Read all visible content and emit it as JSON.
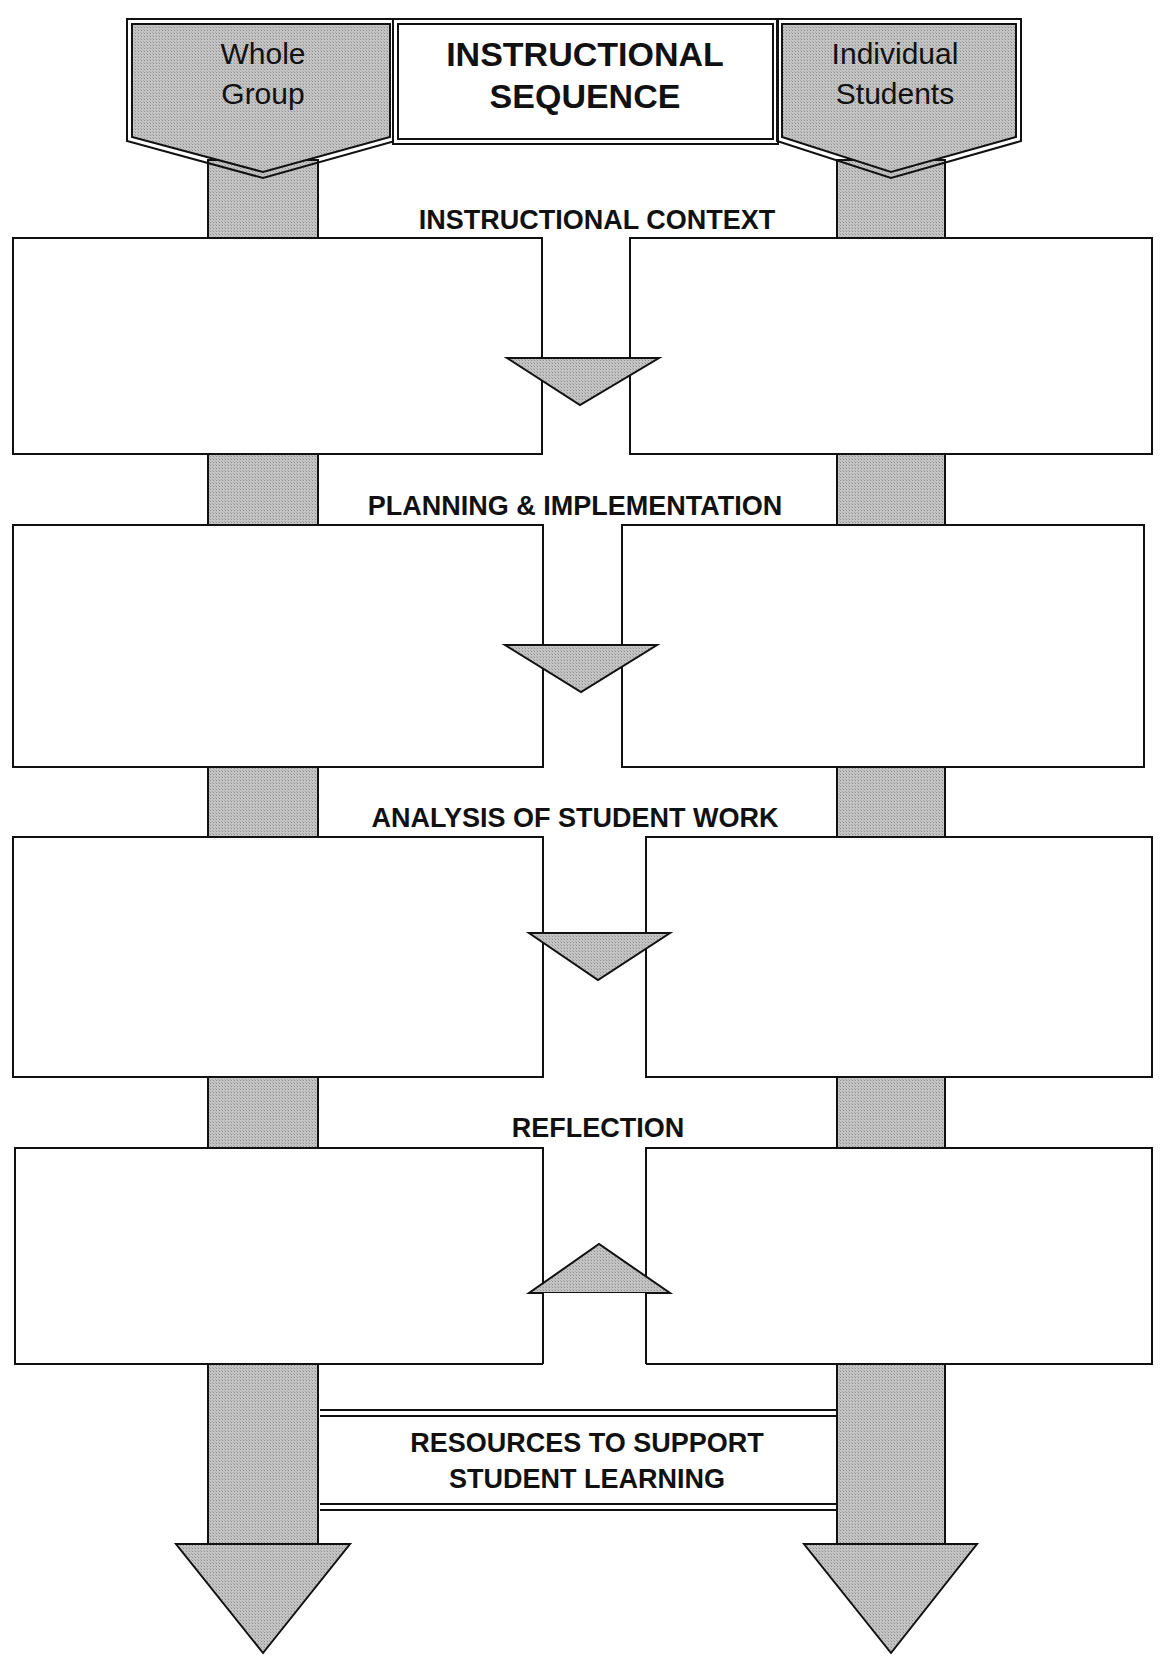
{
  "diagram": {
    "title_line1": "INSTRUCTIONAL",
    "title_line2": "SEQUENCE",
    "left_column": {
      "line1": "Whole",
      "line2": "Group"
    },
    "right_column": {
      "line1": "Individual",
      "line2": "Students"
    },
    "sections": [
      {
        "label": "INSTRUCTIONAL CONTEXT",
        "connector": "down"
      },
      {
        "label": "PLANNING & IMPLEMENTATION",
        "connector": "down"
      },
      {
        "label": "ANALYSIS OF STUDENT WORK",
        "connector": "down"
      },
      {
        "label": "REFLECTION",
        "connector": "up"
      }
    ],
    "resources_line1": "RESOURCES TO SUPPORT",
    "resources_line2": "STUDENT LEARNING",
    "colors": {
      "fill_gray": "#bdbdbd",
      "stroke": "#111111",
      "box_fill": "#ffffff"
    }
  }
}
